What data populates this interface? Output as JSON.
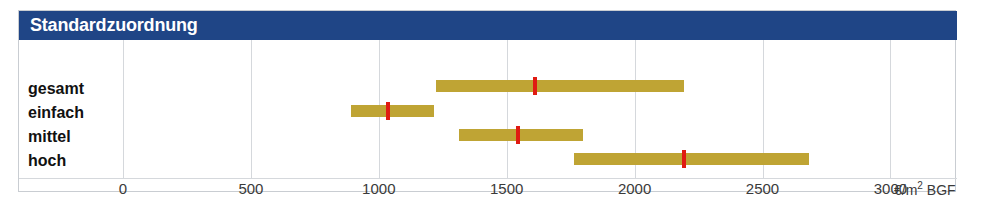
{
  "panel": {
    "title": "Standardzuordnung"
  },
  "axis": {
    "unit_label": "€/m",
    "unit_exponent": "2",
    "unit_suffix": " BGF",
    "ticks": [
      {
        "label": "0",
        "value": 0
      },
      {
        "label": "500",
        "value": 500
      },
      {
        "label": "1000",
        "value": 1000
      },
      {
        "label": "1500",
        "value": 1500
      },
      {
        "label": "2000",
        "value": 2000
      },
      {
        "label": "2500",
        "value": 2500
      },
      {
        "label": "3000",
        "value": 3000
      }
    ]
  },
  "rows": [
    {
      "label": "gesamt"
    },
    {
      "label": "einfach"
    },
    {
      "label": "mittel"
    },
    {
      "label": "hoch"
    }
  ],
  "colors": {
    "title_bar": "#1f4586",
    "title_text": "#ffffff",
    "bar": "#bfa434",
    "median": "#e01b12",
    "gridline": "#d5d8dc",
    "frame": "#c9cdd2"
  },
  "chart_data": {
    "type": "bar",
    "title": "Standardzuordnung",
    "xlabel": "€/m2 BGF",
    "ylabel": "",
    "xlim": [
      0,
      3200
    ],
    "grid": true,
    "legend": "none",
    "orientation": "horizontal",
    "categories": [
      "gesamt",
      "einfach",
      "mittel",
      "hoch"
    ],
    "series": [
      {
        "name": "Spannweite (min)",
        "values": [
          1225,
          890,
          1315,
          1765
        ]
      },
      {
        "name": "Spannweite (max)",
        "values": [
          2195,
          1215,
          1800,
          2680
        ]
      },
      {
        "name": "Median (rote Marke)",
        "values": [
          1610,
          1035,
          1545,
          2195
        ]
      }
    ],
    "ranges": [
      {
        "category": "gesamt",
        "min": 1225,
        "max": 2195,
        "median": 1610
      },
      {
        "category": "einfach",
        "min": 890,
        "max": 1215,
        "median": 1035
      },
      {
        "category": "mittel",
        "min": 1315,
        "max": 1800,
        "median": 1545
      },
      {
        "category": "hoch",
        "min": 1765,
        "max": 2680,
        "median": 2195
      }
    ]
  }
}
